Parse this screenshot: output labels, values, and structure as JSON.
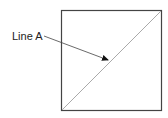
{
  "diagram": {
    "label": "Line A",
    "colors": {
      "box_stroke": "#444444",
      "diagonal": "#aaaaaa",
      "leader": "#444444",
      "arrowhead": "#111111",
      "text": "#222222"
    }
  }
}
